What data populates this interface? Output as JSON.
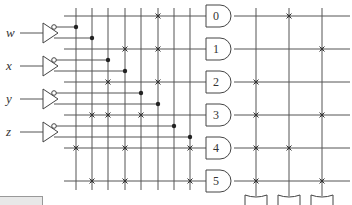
{
  "diagram": {
    "type": "PLA logic diagram",
    "inputs": [
      {
        "label": "w",
        "y": 33,
        "inv_y": 27,
        "true_y": 38
      },
      {
        "label": "x",
        "y": 66,
        "inv_y": 60,
        "true_y": 71
      },
      {
        "label": "y",
        "y": 99,
        "inv_y": 93,
        "true_y": 104
      },
      {
        "label": "z",
        "y": 132,
        "inv_y": 126,
        "true_y": 137
      }
    ],
    "and_gates": [
      {
        "label": "0",
        "y": 16
      },
      {
        "label": "1",
        "y": 49
      },
      {
        "label": "2",
        "y": 82
      },
      {
        "label": "3",
        "y": 115
      },
      {
        "label": "4",
        "y": 148
      },
      {
        "label": "5",
        "y": 181
      }
    ],
    "input_columns_x": [
      76,
      92,
      108,
      125,
      141,
      158,
      174,
      190
    ],
    "output_columns_x": [
      256,
      289,
      322
    ],
    "or_gate_count": 3,
    "and_plane_crosses": [
      {
        "gate": 0,
        "cols_x": [
          158
        ]
      },
      {
        "gate": 1,
        "cols_x": [
          125,
          158
        ]
      },
      {
        "gate": 2,
        "cols_x": [
          108,
          158
        ]
      },
      {
        "gate": 3,
        "cols_x": [
          92,
          108,
          141
        ]
      },
      {
        "gate": 4,
        "cols_x": [
          76,
          125,
          190
        ]
      },
      {
        "gate": 5,
        "cols_x": [
          92,
          125,
          190
        ]
      }
    ],
    "or_plane_crosses": [
      {
        "gate": 0,
        "cols_x": [
          289
        ]
      },
      {
        "gate": 1,
        "cols_x": [
          322
        ]
      },
      {
        "gate": 2,
        "cols_x": [
          256
        ]
      },
      {
        "gate": 3,
        "cols_x": [
          256,
          322
        ]
      },
      {
        "gate": 4,
        "cols_x": [
          256,
          289
        ]
      },
      {
        "gate": 5,
        "cols_x": [
          256,
          322
        ]
      }
    ],
    "colors": {
      "wire": "#555555",
      "dot": "#222222",
      "background": "#ffffff"
    }
  }
}
